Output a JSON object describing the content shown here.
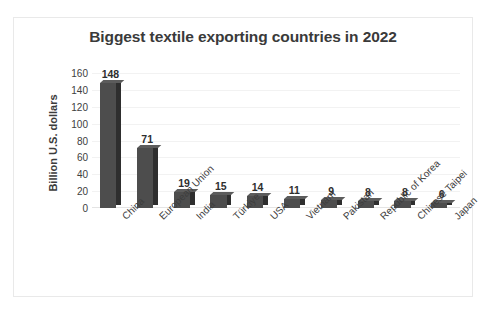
{
  "chart_data": {
    "type": "bar",
    "title": "Biggest textile exporting countries in 2022",
    "xlabel": "",
    "ylabel": "Billion U.S. dollars",
    "categories": [
      "China",
      "European Union",
      "India",
      "Türkiye",
      "USA",
      "Vietnam",
      "Pakistan",
      "Republic of Korea",
      "Chinese Taipei",
      "Japan"
    ],
    "values": [
      148,
      71,
      19,
      15,
      14,
      11,
      9,
      8,
      8,
      6
    ],
    "value_labels": [
      "148",
      "71",
      "19",
      "15",
      "14",
      "11",
      "9",
      "8",
      "8",
      "6"
    ],
    "ylim": [
      0,
      160
    ],
    "ytick_values": [
      0,
      20,
      40,
      60,
      80,
      100,
      120,
      140,
      160
    ],
    "ytick_labels": [
      "0",
      "20",
      "40",
      "60",
      "80",
      "100",
      "120",
      "140",
      "160"
    ],
    "grid": true,
    "legend": false,
    "legend_position": "none",
    "bar_color": "#4d4d4d",
    "bar_side_color": "#2e2e2e",
    "bar_top_color": "#5c5c5c",
    "gridline_color": "#f2f2f2",
    "title_color": "#3a3a3a",
    "text_color": "#3d3d3d"
  }
}
